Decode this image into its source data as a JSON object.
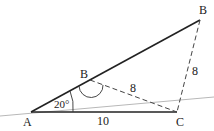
{
  "diagram": {
    "type": "geometry-triangle-ambiguous-case",
    "points": {
      "A": {
        "label": "A"
      },
      "B_outer": {
        "label": "B"
      },
      "B_inner": {
        "label": "B"
      },
      "C": {
        "label": "C"
      }
    },
    "segments": {
      "AC": {
        "label": "10"
      },
      "B_inner_C": {
        "label": "8"
      },
      "B_outer_C": {
        "label": "8"
      }
    },
    "angle_A": {
      "label": "20°"
    },
    "colors": {
      "line": "#222222",
      "reference_line": "#b8b8b8",
      "background": "#ffffff"
    }
  }
}
